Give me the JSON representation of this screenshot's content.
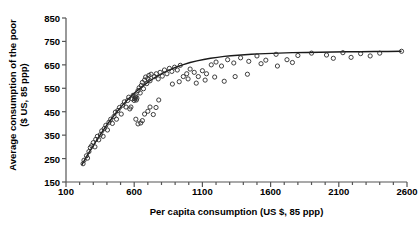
{
  "chart_data": {
    "type": "scatter",
    "title": "",
    "xlabel": "Per capita consumption (US $, 85 ppp)",
    "ylabel_line1": "Average consumption of the poor",
    "ylabel_line2": "($ US, 85 ppp)",
    "xlim": [
      100,
      2600
    ],
    "ylim": [
      150,
      850
    ],
    "xticks": [
      100,
      600,
      1100,
      1600,
      2100,
      2600
    ],
    "xtick_labels": [
      "100",
      "600",
      "1100",
      "1600",
      "2100",
      "2600"
    ],
    "xminor_step": 100,
    "yticks": [
      150,
      250,
      350,
      450,
      550,
      650,
      750,
      850
    ],
    "ytick_labels": [
      "150",
      "250",
      "350",
      "450",
      "550",
      "650",
      "750",
      "850"
    ],
    "grid": false,
    "legend": false,
    "marker": "open-circle",
    "marker_color": "#2b2b2b",
    "line_color": "#1a1a1a",
    "series": [
      {
        "name": "Countries",
        "type": "scatter",
        "points": [
          [
            225,
            228
          ],
          [
            232,
            243
          ],
          [
            250,
            262
          ],
          [
            258,
            252
          ],
          [
            268,
            280
          ],
          [
            278,
            297
          ],
          [
            288,
            305
          ],
          [
            300,
            318
          ],
          [
            312,
            300
          ],
          [
            318,
            332
          ],
          [
            330,
            345
          ],
          [
            340,
            330
          ],
          [
            352,
            352
          ],
          [
            362,
            368
          ],
          [
            372,
            345
          ],
          [
            380,
            378
          ],
          [
            392,
            392
          ],
          [
            404,
            372
          ],
          [
            415,
            405
          ],
          [
            428,
            418
          ],
          [
            440,
            400
          ],
          [
            452,
            430
          ],
          [
            462,
            448
          ],
          [
            470,
            418
          ],
          [
            480,
            455
          ],
          [
            492,
            468
          ],
          [
            505,
            440
          ],
          [
            516,
            478
          ],
          [
            528,
            492
          ],
          [
            540,
            470
          ],
          [
            552,
            498
          ],
          [
            560,
            512
          ],
          [
            568,
            462
          ],
          [
            576,
            470
          ],
          [
            584,
            505
          ],
          [
            592,
            520
          ],
          [
            600,
            498
          ],
          [
            604,
            505
          ],
          [
            608,
            512
          ],
          [
            612,
            518
          ],
          [
            616,
            500
          ],
          [
            620,
            508
          ],
          [
            628,
            540
          ],
          [
            636,
            552
          ],
          [
            644,
            530
          ],
          [
            652,
            562
          ],
          [
            660,
            575
          ],
          [
            668,
            548
          ],
          [
            676,
            585
          ],
          [
            684,
            598
          ],
          [
            692,
            570
          ],
          [
            700,
            592
          ],
          [
            708,
            605
          ],
          [
            716,
            582
          ],
          [
            724,
            610
          ],
          [
            612,
            418
          ],
          [
            628,
            398
          ],
          [
            648,
            402
          ],
          [
            660,
            412
          ],
          [
            676,
            440
          ],
          [
            700,
            452
          ],
          [
            716,
            470
          ],
          [
            740,
            438
          ],
          [
            760,
            468
          ],
          [
            780,
            500
          ],
          [
            748,
            600
          ],
          [
            762,
            612
          ],
          [
            776,
            590
          ],
          [
            790,
            618
          ],
          [
            806,
            602
          ],
          [
            822,
            628
          ],
          [
            840,
            612
          ],
          [
            858,
            635
          ],
          [
            876,
            622
          ],
          [
            896,
            640
          ],
          [
            916,
            628
          ],
          [
            938,
            648
          ],
          [
            960,
            600
          ],
          [
            985,
            612
          ],
          [
            1010,
            632
          ],
          [
            1040,
            618
          ],
          [
            1070,
            600
          ],
          [
            1100,
            625
          ],
          [
            1130,
            612
          ],
          [
            1165,
            650
          ],
          [
            1200,
            662
          ],
          [
            1240,
            645
          ],
          [
            1285,
            672
          ],
          [
            1330,
            658
          ],
          [
            1380,
            680
          ],
          [
            1440,
            665
          ],
          [
            1500,
            688
          ],
          [
            1565,
            670
          ],
          [
            1640,
            695
          ],
          [
            1720,
            672
          ],
          [
            1800,
            690
          ],
          [
            1900,
            700
          ],
          [
            2010,
            692
          ],
          [
            2130,
            702
          ],
          [
            2260,
            698
          ],
          [
            2400,
            700
          ],
          [
            2560,
            708
          ],
          [
            880,
            568
          ],
          [
            930,
            578
          ],
          [
            995,
            590
          ],
          [
            1055,
            572
          ],
          [
            1120,
            585
          ],
          [
            1190,
            598
          ],
          [
            1260,
            580
          ],
          [
            1340,
            600
          ],
          [
            1430,
            610
          ],
          [
            1530,
            655
          ],
          [
            1650,
            645
          ],
          [
            1760,
            660
          ],
          [
            2060,
            678
          ],
          [
            2190,
            682
          ],
          [
            2330,
            688
          ]
        ]
      },
      {
        "name": "Fitted curve",
        "type": "line",
        "points": [
          [
            215,
            222
          ],
          [
            260,
            268
          ],
          [
            310,
            315
          ],
          [
            360,
            360
          ],
          [
            410,
            402
          ],
          [
            460,
            440
          ],
          [
            510,
            475
          ],
          [
            560,
            506
          ],
          [
            610,
            534
          ],
          [
            660,
            558
          ],
          [
            710,
            580
          ],
          [
            760,
            599
          ],
          [
            810,
            615
          ],
          [
            860,
            629
          ],
          [
            910,
            641
          ],
          [
            960,
            651
          ],
          [
            1010,
            660
          ],
          [
            1060,
            667
          ],
          [
            1110,
            673
          ],
          [
            1160,
            678
          ],
          [
            1210,
            682
          ],
          [
            1260,
            686
          ],
          [
            1310,
            689
          ],
          [
            1360,
            691
          ],
          [
            1410,
            693
          ],
          [
            1460,
            695
          ],
          [
            1510,
            697
          ],
          [
            1560,
            698
          ],
          [
            1660,
            700
          ],
          [
            1760,
            702
          ],
          [
            1860,
            703
          ],
          [
            1960,
            704
          ],
          [
            2060,
            705
          ],
          [
            2160,
            706
          ],
          [
            2260,
            706
          ],
          [
            2360,
            707
          ],
          [
            2460,
            707
          ],
          [
            2560,
            708
          ]
        ]
      }
    ]
  },
  "axes": {
    "axis_color": "#555555",
    "plot_left_px": 66,
    "plot_right_px": 407,
    "plot_bottom_px": 182,
    "plot_top_px": 18
  }
}
